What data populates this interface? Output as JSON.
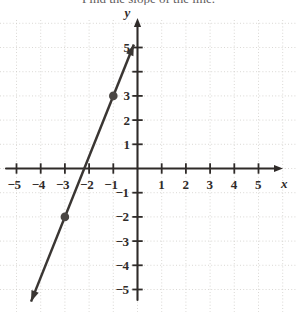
{
  "caption": {
    "text": "Find the slope of the line."
  },
  "axes": {
    "x_label": "x",
    "y_label": "y",
    "x_ticks": [
      {
        "value": -5,
        "label": "−5"
      },
      {
        "value": -4,
        "label": "−4"
      },
      {
        "value": -3,
        "label": "−3"
      },
      {
        "value": -2,
        "label": "−2"
      },
      {
        "value": -1,
        "label": "−1"
      },
      {
        "value": 1,
        "label": "1"
      },
      {
        "value": 2,
        "label": "2"
      },
      {
        "value": 3,
        "label": "3"
      },
      {
        "value": 4,
        "label": "4"
      },
      {
        "value": 5,
        "label": "5"
      }
    ],
    "y_ticks": [
      {
        "value": 5,
        "label": "5"
      },
      {
        "value": 3,
        "label": "3"
      },
      {
        "value": 2,
        "label": "2"
      },
      {
        "value": 1,
        "label": "1"
      },
      {
        "value": -1,
        "label": "−1"
      },
      {
        "value": -2,
        "label": "−2"
      },
      {
        "value": -3,
        "label": "−3"
      },
      {
        "value": -4,
        "label": "−4"
      },
      {
        "value": -5,
        "label": "−5"
      }
    ]
  },
  "colors": {
    "axis": "#2f2b29",
    "line": "#3a3633",
    "grid": "#c9c6c2",
    "point": "#4a4644",
    "text": "#2f2b29",
    "background": "#ffffff"
  },
  "chart_data": {
    "type": "line",
    "title": "",
    "xlabel": "x",
    "ylabel": "y",
    "xlim": [
      -5.8,
      5.8
    ],
    "ylim": [
      -5.9,
      6.0
    ],
    "grid": true,
    "grid_style": "dotted",
    "legend": "none",
    "series": [
      {
        "name": "line",
        "slope": 2.5,
        "y_intercept": 5.5,
        "x_intercept": -2.2,
        "equation": "y = 2.5x + 5.5",
        "x": [
          -5.2,
          0.2
        ],
        "y": [
          -7.5,
          6.0
        ],
        "arrow_start": true,
        "arrow_end": true,
        "draw_x_from": -4.4,
        "draw_x_to": -0.15
      }
    ],
    "points": [
      {
        "x": -3,
        "y": -2,
        "label": "(-3, -2)"
      },
      {
        "x": -1,
        "y": 3,
        "label": "(-1, 3)"
      }
    ]
  }
}
